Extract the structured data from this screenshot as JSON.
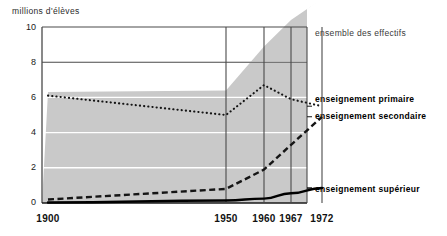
{
  "chart_data": {
    "type": "area",
    "title": "",
    "subtitle": "",
    "xlabel": "",
    "ylabel": "millions d'élèves",
    "ylim": [
      0,
      10
    ],
    "xlim": [
      1900,
      1972
    ],
    "yticks": [
      0,
      2,
      4,
      6,
      8,
      10
    ],
    "ytick_labels": [
      "0",
      "2",
      "4",
      "6",
      "8",
      "10"
    ],
    "xticks": [
      1900,
      1950,
      1960,
      1967,
      1972
    ],
    "xtick_labels": [
      "1900",
      "1950",
      "1960",
      "1967",
      "1972"
    ],
    "grid": true,
    "legend_position": "right",
    "x": [
      1900,
      1950,
      1960,
      1967,
      1972
    ],
    "series": [
      {
        "name": "ensemble des effectifs",
        "style": "filled-area",
        "color": "#c9c9c9",
        "values": [
          6.3,
          6.4,
          8.9,
          10.4,
          11.6
        ]
      },
      {
        "name": "enseignement primaire",
        "style": "dotted",
        "color": "#1a1a1a",
        "values": [
          6.1,
          5.0,
          6.7,
          5.9,
          5.5
        ]
      },
      {
        "name": "enseignement secondaire",
        "style": "dashed",
        "color": "#1a1a1a",
        "values": [
          0.2,
          0.8,
          1.9,
          3.3,
          4.9
        ]
      },
      {
        "name": "enseignement supérieur",
        "style": "solid",
        "color": "#000000",
        "values": [
          0.03,
          0.14,
          0.25,
          0.55,
          0.85
        ]
      }
    ],
    "annotations": [
      {
        "text": "ensemble des effectifs",
        "weight": "normal"
      },
      {
        "text": "enseignement primaire",
        "weight": "bold"
      },
      {
        "text": "enseignement secondaire",
        "weight": "bold"
      },
      {
        "text": "enseignement supérieur",
        "weight": "bold"
      }
    ]
  },
  "colors": {
    "background": "#ffffff",
    "area_fill": "#c9c9c9",
    "gridline": "#ffffff",
    "frame": "#4a4a4a",
    "ink": "#111111"
  }
}
